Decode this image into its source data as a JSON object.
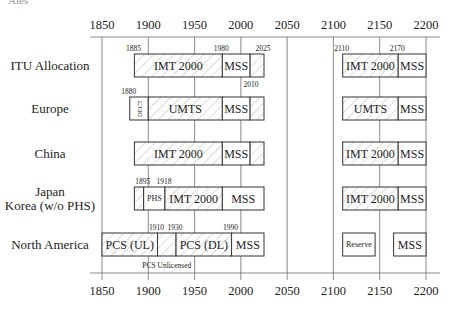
{
  "caption_fragment": "Ales",
  "chart_data": {
    "type": "timeline",
    "title": "",
    "xlabel": "Frequency (MHz)",
    "axis": {
      "min": 1850,
      "max": 2200,
      "ticks": [
        1850,
        1900,
        1950,
        2000,
        2050,
        2100,
        2150,
        2200
      ],
      "tick_labels": [
        "1850",
        "1900",
        "1950",
        "2000",
        "2050",
        "2100",
        "2150",
        "2200"
      ],
      "grid": true
    },
    "rows": [
      {
        "label": [
          "ITU Allocation"
        ],
        "segments": [
          {
            "start": 1885,
            "end": 1980,
            "label": "IMT 2000",
            "hatched": true
          },
          {
            "start": 1980,
            "end": 2010,
            "label": "MSS",
            "hatched": false
          },
          {
            "start": 2010,
            "end": 2025,
            "label": "",
            "hatched": true
          },
          {
            "start": 2110,
            "end": 2170,
            "label": "IMT 2000",
            "hatched": true
          },
          {
            "start": 2170,
            "end": 2200,
            "label": "MSS",
            "hatched": false
          }
        ],
        "annotations": [
          {
            "value": 1885,
            "text": "1885",
            "pos": "above"
          },
          {
            "value": 1980,
            "text": "1980",
            "pos": "above"
          },
          {
            "value": 2025,
            "text": "2025",
            "pos": "above"
          },
          {
            "value": 2010,
            "text": "2010",
            "pos": "below"
          },
          {
            "value": 2110,
            "text": "2110",
            "pos": "above"
          },
          {
            "value": 2170,
            "text": "2170",
            "pos": "above"
          }
        ]
      },
      {
        "label": [
          "Europe"
        ],
        "segments": [
          {
            "start": 1880,
            "end": 1900,
            "label": "DECT",
            "hatched": false,
            "vertical": true
          },
          {
            "start": 1900,
            "end": 1980,
            "label": "UMTS",
            "hatched": true
          },
          {
            "start": 1980,
            "end": 2010,
            "label": "MSS",
            "hatched": false
          },
          {
            "start": 2010,
            "end": 2025,
            "label": "",
            "hatched": true
          },
          {
            "start": 2110,
            "end": 2170,
            "label": "UMTS",
            "hatched": true
          },
          {
            "start": 2170,
            "end": 2200,
            "label": "MSS",
            "hatched": false
          }
        ],
        "annotations": [
          {
            "value": 1880,
            "text": "1880",
            "pos": "above"
          }
        ]
      },
      {
        "label": [
          "China"
        ],
        "segments": [
          {
            "start": 1885,
            "end": 1980,
            "label": "IMT 2000",
            "hatched": true
          },
          {
            "start": 1980,
            "end": 2010,
            "label": "MSS",
            "hatched": false
          },
          {
            "start": 2010,
            "end": 2025,
            "label": "",
            "hatched": true
          },
          {
            "start": 2110,
            "end": 2170,
            "label": "IMT 2000",
            "hatched": true
          },
          {
            "start": 2170,
            "end": 2200,
            "label": "MSS",
            "hatched": false
          }
        ],
        "annotations": []
      },
      {
        "label": [
          "Japan",
          "Korea (w/o PHS)"
        ],
        "segments": [
          {
            "start": 1885,
            "end": 1895,
            "label": "",
            "hatched": true
          },
          {
            "start": 1895,
            "end": 1918,
            "label": "PHS",
            "hatched": false,
            "small": true
          },
          {
            "start": 1918,
            "end": 1980,
            "label": "IMT 2000",
            "hatched": true
          },
          {
            "start": 1980,
            "end": 2025,
            "label": "MSS",
            "hatched": false
          },
          {
            "start": 2110,
            "end": 2170,
            "label": "IMT 2000",
            "hatched": true
          },
          {
            "start": 2170,
            "end": 2200,
            "label": "MSS",
            "hatched": false
          }
        ],
        "annotations": [
          {
            "value": 1895,
            "text": "1895",
            "pos": "above"
          },
          {
            "value": 1918,
            "text": "1918",
            "pos": "above"
          }
        ]
      },
      {
        "label": [
          "North America"
        ],
        "segments": [
          {
            "start": 1850,
            "end": 1910,
            "label": "PCS (UL)",
            "hatched": true
          },
          {
            "start": 1910,
            "end": 1930,
            "label": "",
            "hatched": true
          },
          {
            "start": 1930,
            "end": 1990,
            "label": "PCS (DL)",
            "hatched": true
          },
          {
            "start": 1990,
            "end": 2025,
            "label": "MSS",
            "hatched": false
          },
          {
            "start": 2110,
            "end": 2145,
            "label": "Reserve",
            "hatched": false,
            "small": true
          },
          {
            "start": 2165,
            "end": 2200,
            "label": "MSS",
            "hatched": false
          }
        ],
        "annotations": [
          {
            "value": 1910,
            "text": "1910",
            "pos": "above"
          },
          {
            "value": 1930,
            "text": "1930",
            "pos": "above"
          },
          {
            "value": 1990,
            "text": "1990",
            "pos": "above"
          },
          {
            "value": 1920,
            "text": "PCS Unlicensed",
            "pos": "below"
          }
        ]
      }
    ]
  }
}
